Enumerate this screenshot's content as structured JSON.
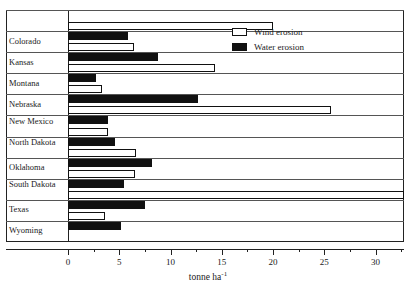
{
  "chart_data": {
    "type": "bar",
    "orientation": "horizontal",
    "title": "",
    "xlabel": "tonne ha",
    "xlabel_sup": "-1",
    "ylabel": "",
    "xlim": [
      0,
      32.8
    ],
    "grid": false,
    "legend_position": "top-right",
    "categories": [
      "Colorado",
      "Kansas",
      "Montana",
      "Nebraska",
      "New Mexico",
      "North Dakota",
      "Oklahoma",
      "South Dakota",
      "Texas",
      "Wyoming"
    ],
    "tick_labels": [
      "0",
      "5",
      "10",
      "15",
      "20",
      "25",
      "30"
    ],
    "tick_values": [
      0,
      5,
      10,
      15,
      20,
      25,
      30
    ],
    "minor_tick_values": [
      2.5,
      7.5,
      12.5,
      17.5,
      22.5,
      27.5,
      32.5
    ],
    "series": [
      {
        "name": "Wind erosion",
        "color": "#ffffff",
        "edge_color": "#111111",
        "values": [
          20.0,
          6.4,
          14.3,
          3.3,
          25.7,
          3.9,
          6.6,
          6.5,
          32.8,
          3.6
        ]
      },
      {
        "name": "Water erosion",
        "color": "#111111",
        "edge_color": "#111111",
        "values": [
          5.9,
          8.8,
          2.7,
          12.7,
          3.9,
          4.6,
          8.2,
          5.5,
          7.5,
          5.2
        ]
      }
    ]
  },
  "legend": {
    "items": [
      {
        "label": "Wind erosion",
        "swatch": "open-square-icon"
      },
      {
        "label": "Water erosion",
        "swatch": "filled-square-icon"
      }
    ]
  }
}
